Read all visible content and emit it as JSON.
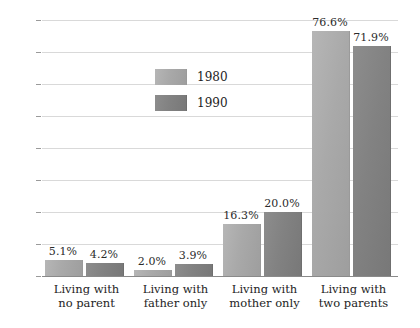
{
  "chart_data": {
    "type": "bar",
    "title": "",
    "subtitle": "",
    "xlabel": "",
    "ylabel": "",
    "ylim": [
      0,
      80
    ],
    "ytick_step": 10,
    "ytick_labels": [
      "0",
      "10",
      "20",
      "30",
      "40",
      "50",
      "60",
      "70",
      "80"
    ],
    "grid": true,
    "legend_position": "inside-upper-left",
    "categories": [
      "Living with no parent",
      "Living with father only",
      "Living with mother only",
      "Living with two parents"
    ],
    "category_lines": [
      [
        "Living with",
        "no parent"
      ],
      [
        "Living with",
        "father only"
      ],
      [
        "Living with",
        "mother only"
      ],
      [
        "Living with",
        "two parents"
      ]
    ],
    "series": [
      {
        "name": "1980",
        "color": "#a9a9a9",
        "values": [
          5.1,
          2.0,
          16.3,
          76.6
        ],
        "data_labels": [
          "5.1%",
          "2.0%",
          "16.3%",
          "76.6%"
        ]
      },
      {
        "name": "1990",
        "color": "#828282",
        "values": [
          4.2,
          3.9,
          20.0,
          71.9
        ],
        "data_labels": [
          "4.2%",
          "3.9%",
          "20.0%",
          "71.9%"
        ]
      }
    ]
  },
  "legend": {
    "entries": [
      {
        "label": "1980"
      },
      {
        "label": "1990"
      }
    ]
  },
  "colors": {
    "series_1980": "#a9a9a9",
    "series_1990": "#828282",
    "gridline": "#d9d9d9",
    "axis": "#8a8a8a",
    "text": "#1d1d1d",
    "background": "#ffffff"
  }
}
